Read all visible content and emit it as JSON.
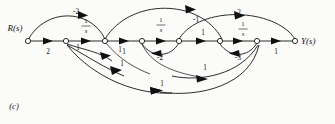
{
  "figure": {
    "panel_label": "(c)",
    "type": "signal-flow-graph",
    "input_label": "R(s)",
    "output_label": "Y(s)",
    "nodes": [
      {
        "id": "n0",
        "x": 28,
        "y": 41,
        "name": "input-node"
      },
      {
        "id": "n1",
        "x": 66,
        "y": 41,
        "name": "node-1"
      },
      {
        "id": "n2",
        "x": 105,
        "y": 41,
        "name": "node-2"
      },
      {
        "id": "n3",
        "x": 142,
        "y": 41,
        "name": "node-3"
      },
      {
        "id": "n4",
        "x": 179,
        "y": 41,
        "name": "node-4"
      },
      {
        "id": "n5",
        "x": 220,
        "y": 41,
        "name": "node-5"
      },
      {
        "id": "n6",
        "x": 257,
        "y": 41,
        "name": "node-6"
      },
      {
        "id": "n7",
        "x": 295,
        "y": 41,
        "name": "output-node"
      }
    ],
    "forward_edges": [
      {
        "from": "n0",
        "to": "n1",
        "gain": "2",
        "gain_type": "plain"
      },
      {
        "from": "n1",
        "to": "n2",
        "gain": "1/s",
        "gain_type": "fraction",
        "num": "1",
        "den": "s"
      },
      {
        "from": "n2",
        "to": "n3",
        "gain": "1",
        "gain_type": "plain"
      },
      {
        "from": "n3",
        "to": "n4",
        "gain": "1/s",
        "gain_type": "fraction",
        "num": "1",
        "den": "s"
      },
      {
        "from": "n4",
        "to": "n5",
        "gain": "1",
        "gain_type": "plain"
      },
      {
        "from": "n5",
        "to": "n6",
        "gain": "1/s",
        "gain_type": "fraction",
        "num": "1",
        "den": "s"
      },
      {
        "from": "n6",
        "to": "n7",
        "gain": "1",
        "gain_type": "plain"
      }
    ],
    "upper_arcs": [
      {
        "name": "arc-feedforward-minus2",
        "gain": "-2",
        "from": "n0",
        "to": "n2"
      },
      {
        "name": "arc-feedforward-minus1",
        "gain": "-1",
        "from": "n2",
        "to": "n5"
      },
      {
        "name": "arc-feedforward-2",
        "gain": "2",
        "from": "n4",
        "to": "n7"
      }
    ],
    "lower_arcs": [
      {
        "name": "arc-feedback-1-a",
        "gain": "1",
        "from": "n1",
        "to": "n2"
      },
      {
        "name": "arc-feedback-1-b",
        "gain": "1",
        "from": "n1",
        "to": "n3"
      },
      {
        "name": "arc-feedback-1-c",
        "gain": "1",
        "from": "n1",
        "to": "n4"
      },
      {
        "name": "arc-feedback-minus2",
        "gain": "-2",
        "from": "n4",
        "to": "n3"
      },
      {
        "name": "arc-feedback-minus3",
        "gain": "-3",
        "from": "n6",
        "to": "n5"
      },
      {
        "name": "arc-feedback-1-d",
        "gain": "1",
        "from": "n6",
        "to": "n4"
      },
      {
        "name": "arc-feedback-1-e",
        "gain": "1",
        "from": "n6",
        "to": "n2"
      }
    ],
    "colors": {
      "stroke": "#151515",
      "node_fill": "#ffffff",
      "background": "#fbfbfa"
    }
  }
}
